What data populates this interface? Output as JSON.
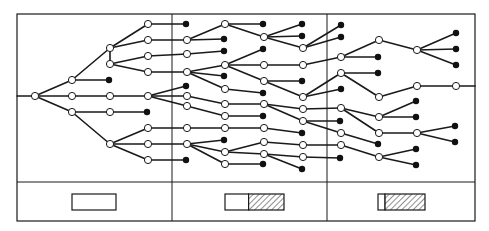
{
  "figure": {
    "title": "",
    "frame": {
      "x": 17,
      "y": 14,
      "width": 458,
      "height": 207
    },
    "legend_divider_y": 182,
    "column_dividers_x": [
      172,
      327
    ],
    "colors": {
      "line": "#1a1a1a",
      "background": "#ffffff",
      "filled_node": "#111111"
    }
  },
  "nodes": [
    {
      "id": "r",
      "x": 35,
      "y": 96,
      "type": "open"
    },
    {
      "id": "a1",
      "x": 72,
      "y": 80,
      "type": "open"
    },
    {
      "id": "a2",
      "x": 72,
      "y": 96,
      "type": "open"
    },
    {
      "id": "a3",
      "x": 72,
      "y": 112,
      "type": "open"
    },
    {
      "id": "b1",
      "x": 110,
      "y": 48,
      "type": "open"
    },
    {
      "id": "b2",
      "x": 110,
      "y": 64,
      "type": "open"
    },
    {
      "id": "b3",
      "x": 109,
      "y": 80,
      "type": "filled"
    },
    {
      "id": "b4",
      "x": 110,
      "y": 96,
      "type": "open"
    },
    {
      "id": "b5",
      "x": 110,
      "y": 112,
      "type": "open"
    },
    {
      "id": "b6",
      "x": 110,
      "y": 144,
      "type": "open"
    },
    {
      "id": "c1",
      "x": 148,
      "y": 24,
      "type": "open"
    },
    {
      "id": "c2",
      "x": 148,
      "y": 40,
      "type": "open"
    },
    {
      "id": "c3",
      "x": 148,
      "y": 56,
      "type": "open"
    },
    {
      "id": "c4",
      "x": 148,
      "y": 72,
      "type": "open"
    },
    {
      "id": "c5",
      "x": 148,
      "y": 96,
      "type": "open"
    },
    {
      "id": "c6",
      "x": 147,
      "y": 112,
      "type": "filled"
    },
    {
      "id": "c7",
      "x": 148,
      "y": 128,
      "type": "open"
    },
    {
      "id": "c8",
      "x": 148,
      "y": 144,
      "type": "open"
    },
    {
      "id": "c9",
      "x": 148,
      "y": 160,
      "type": "open"
    },
    {
      "id": "d1",
      "x": 186,
      "y": 24,
      "type": "filled"
    },
    {
      "id": "d2",
      "x": 187,
      "y": 40,
      "type": "open"
    },
    {
      "id": "d3",
      "x": 187,
      "y": 54,
      "type": "open"
    },
    {
      "id": "d4",
      "x": 187,
      "y": 72,
      "type": "open"
    },
    {
      "id": "d5",
      "x": 186,
      "y": 86,
      "type": "filled"
    },
    {
      "id": "d6",
      "x": 187,
      "y": 96,
      "type": "open"
    },
    {
      "id": "d7",
      "x": 187,
      "y": 106,
      "type": "open"
    },
    {
      "id": "d8",
      "x": 187,
      "y": 128,
      "type": "open"
    },
    {
      "id": "d9",
      "x": 187,
      "y": 144,
      "type": "open"
    },
    {
      "id": "d10",
      "x": 186,
      "y": 160,
      "type": "filled"
    },
    {
      "id": "e1",
      "x": 225,
      "y": 24,
      "type": "open"
    },
    {
      "id": "e2",
      "x": 224,
      "y": 39,
      "type": "filled"
    },
    {
      "id": "e3",
      "x": 224,
      "y": 51,
      "type": "filled"
    },
    {
      "id": "e4",
      "x": 225,
      "y": 65,
      "type": "open"
    },
    {
      "id": "e5",
      "x": 224,
      "y": 76,
      "type": "filled"
    },
    {
      "id": "e6",
      "x": 225,
      "y": 89,
      "type": "open"
    },
    {
      "id": "e7",
      "x": 225,
      "y": 104,
      "type": "open"
    },
    {
      "id": "e8",
      "x": 225,
      "y": 116,
      "type": "open"
    },
    {
      "id": "e9",
      "x": 225,
      "y": 128,
      "type": "open"
    },
    {
      "id": "e10",
      "x": 224,
      "y": 140,
      "type": "filled"
    },
    {
      "id": "e11",
      "x": 225,
      "y": 152,
      "type": "open"
    },
    {
      "id": "e12",
      "x": 225,
      "y": 164,
      "type": "open"
    },
    {
      "id": "f1",
      "x": 263,
      "y": 24,
      "type": "filled"
    },
    {
      "id": "f2",
      "x": 264,
      "y": 37,
      "type": "open"
    },
    {
      "id": "f3",
      "x": 263,
      "y": 49,
      "type": "filled"
    },
    {
      "id": "f4",
      "x": 264,
      "y": 65,
      "type": "open"
    },
    {
      "id": "f5",
      "x": 264,
      "y": 81,
      "type": "open"
    },
    {
      "id": "f6",
      "x": 263,
      "y": 93,
      "type": "filled"
    },
    {
      "id": "f7",
      "x": 264,
      "y": 104,
      "type": "open"
    },
    {
      "id": "f8",
      "x": 263,
      "y": 116,
      "type": "filled"
    },
    {
      "id": "f9",
      "x": 264,
      "y": 128,
      "type": "open"
    },
    {
      "id": "f10",
      "x": 264,
      "y": 142,
      "type": "open"
    },
    {
      "id": "f11",
      "x": 264,
      "y": 154,
      "type": "open"
    },
    {
      "id": "f12",
      "x": 263,
      "y": 164,
      "type": "filled"
    },
    {
      "id": "g1",
      "x": 302,
      "y": 24,
      "type": "filled"
    },
    {
      "id": "g2",
      "x": 302,
      "y": 36,
      "type": "filled"
    },
    {
      "id": "g3",
      "x": 303,
      "y": 48,
      "type": "open"
    },
    {
      "id": "g4",
      "x": 303,
      "y": 65,
      "type": "open"
    },
    {
      "id": "g5",
      "x": 302,
      "y": 81,
      "type": "filled"
    },
    {
      "id": "g6",
      "x": 303,
      "y": 97,
      "type": "open"
    },
    {
      "id": "g7",
      "x": 303,
      "y": 109,
      "type": "open"
    },
    {
      "id": "g8",
      "x": 303,
      "y": 121,
      "type": "open"
    },
    {
      "id": "g9",
      "x": 302,
      "y": 133,
      "type": "filled"
    },
    {
      "id": "g10",
      "x": 303,
      "y": 145,
      "type": "open"
    },
    {
      "id": "g11",
      "x": 303,
      "y": 157,
      "type": "open"
    },
    {
      "id": "g12",
      "x": 302,
      "y": 169,
      "type": "filled"
    },
    {
      "id": "h1",
      "x": 341,
      "y": 25,
      "type": "filled"
    },
    {
      "id": "h2",
      "x": 341,
      "y": 37,
      "type": "filled"
    },
    {
      "id": "h3",
      "x": 341,
      "y": 57,
      "type": "open"
    },
    {
      "id": "h4",
      "x": 341,
      "y": 73,
      "type": "open"
    },
    {
      "id": "h5",
      "x": 341,
      "y": 89,
      "type": "filled"
    },
    {
      "id": "h6",
      "x": 341,
      "y": 108,
      "type": "open"
    },
    {
      "id": "h7",
      "x": 340,
      "y": 121,
      "type": "filled"
    },
    {
      "id": "h8",
      "x": 341,
      "y": 133,
      "type": "open"
    },
    {
      "id": "h9",
      "x": 341,
      "y": 145,
      "type": "open"
    },
    {
      "id": "h10",
      "x": 340,
      "y": 158,
      "type": "filled"
    },
    {
      "id": "i1",
      "x": 379,
      "y": 40,
      "type": "open"
    },
    {
      "id": "i2",
      "x": 378,
      "y": 57,
      "type": "filled"
    },
    {
      "id": "i3",
      "x": 378,
      "y": 73,
      "type": "filled"
    },
    {
      "id": "i4",
      "x": 379,
      "y": 97,
      "type": "open"
    },
    {
      "id": "i5",
      "x": 379,
      "y": 117,
      "type": "open"
    },
    {
      "id": "i6",
      "x": 379,
      "y": 133,
      "type": "open"
    },
    {
      "id": "i7",
      "x": 378,
      "y": 144,
      "type": "filled"
    },
    {
      "id": "i8",
      "x": 379,
      "y": 157,
      "type": "open"
    },
    {
      "id": "j1",
      "x": 417,
      "y": 50,
      "type": "open"
    },
    {
      "id": "j2",
      "x": 417,
      "y": 86,
      "type": "open"
    },
    {
      "id": "j3",
      "x": 416,
      "y": 101,
      "type": "filled"
    },
    {
      "id": "j4",
      "x": 416,
      "y": 117,
      "type": "filled"
    },
    {
      "id": "j5",
      "x": 417,
      "y": 133,
      "type": "open"
    },
    {
      "id": "j6",
      "x": 416,
      "y": 149,
      "type": "filled"
    },
    {
      "id": "j7",
      "x": 416,
      "y": 165,
      "type": "filled"
    },
    {
      "id": "k1",
      "x": 456,
      "y": 33,
      "type": "filled"
    },
    {
      "id": "k2",
      "x": 456,
      "y": 49,
      "type": "filled"
    },
    {
      "id": "k3",
      "x": 456,
      "y": 65,
      "type": "filled"
    },
    {
      "id": "k4",
      "x": 456,
      "y": 86,
      "type": "open"
    },
    {
      "id": "k5",
      "x": 455,
      "y": 126,
      "type": "filled"
    },
    {
      "id": "k6",
      "x": 455,
      "y": 142,
      "type": "filled"
    }
  ],
  "edges": [
    [
      "r",
      "a1"
    ],
    [
      "r",
      "a2"
    ],
    [
      "r",
      "a3"
    ],
    [
      "a1",
      "b1"
    ],
    [
      "a1",
      "b3"
    ],
    [
      "a2",
      "b4"
    ],
    [
      "a3",
      "b5"
    ],
    [
      "a3",
      "b6"
    ],
    [
      "b1",
      "c1"
    ],
    [
      "b1",
      "c2"
    ],
    [
      "b2",
      "c3"
    ],
    [
      "b2",
      "c4"
    ],
    [
      "b1",
      "b2"
    ],
    [
      "b4",
      "c5"
    ],
    [
      "b5",
      "c6"
    ],
    [
      "b6",
      "c7"
    ],
    [
      "b6",
      "c8"
    ],
    [
      "b6",
      "c9"
    ],
    [
      "c1",
      "d1"
    ],
    [
      "c2",
      "d2"
    ],
    [
      "c3",
      "d3"
    ],
    [
      "c4",
      "d4"
    ],
    [
      "c5",
      "d5"
    ],
    [
      "c5",
      "d6"
    ],
    [
      "c5",
      "d7"
    ],
    [
      "c7",
      "d8"
    ],
    [
      "c8",
      "d9"
    ],
    [
      "c9",
      "d10"
    ],
    [
      "d2",
      "e1"
    ],
    [
      "d2",
      "e2"
    ],
    [
      "d3",
      "e3"
    ],
    [
      "d4",
      "e4"
    ],
    [
      "d4",
      "e5"
    ],
    [
      "d4",
      "e6"
    ],
    [
      "d6",
      "e7"
    ],
    [
      "d7",
      "e8"
    ],
    [
      "d8",
      "e9"
    ],
    [
      "d9",
      "e10"
    ],
    [
      "d9",
      "e11"
    ],
    [
      "d9",
      "e12"
    ],
    [
      "e1",
      "f1"
    ],
    [
      "e1",
      "f2"
    ],
    [
      "e4",
      "f3"
    ],
    [
      "e4",
      "f4"
    ],
    [
      "e4",
      "f5"
    ],
    [
      "e6",
      "f6"
    ],
    [
      "e7",
      "f7"
    ],
    [
      "e8",
      "f8"
    ],
    [
      "e9",
      "f9"
    ],
    [
      "e11",
      "f10"
    ],
    [
      "e11",
      "f11"
    ],
    [
      "e12",
      "f12"
    ],
    [
      "f2",
      "g1"
    ],
    [
      "f2",
      "g2"
    ],
    [
      "f2",
      "g3"
    ],
    [
      "f4",
      "g4"
    ],
    [
      "f5",
      "g5"
    ],
    [
      "f5",
      "g6"
    ],
    [
      "f7",
      "g7"
    ],
    [
      "f7",
      "g8"
    ],
    [
      "f9",
      "g9"
    ],
    [
      "f10",
      "g10"
    ],
    [
      "f11",
      "g11"
    ],
    [
      "f11",
      "g12"
    ],
    [
      "g3",
      "h1"
    ],
    [
      "g3",
      "h2"
    ],
    [
      "g4",
      "h3"
    ],
    [
      "g6",
      "h4"
    ],
    [
      "g6",
      "h5"
    ],
    [
      "g7",
      "h6"
    ],
    [
      "g8",
      "h7"
    ],
    [
      "g8",
      "h8"
    ],
    [
      "g10",
      "h9"
    ],
    [
      "g11",
      "h10"
    ],
    [
      "h3",
      "i1"
    ],
    [
      "h3",
      "i2"
    ],
    [
      "h4",
      "i3"
    ],
    [
      "h4",
      "i4"
    ],
    [
      "h6",
      "i5"
    ],
    [
      "h6",
      "i6"
    ],
    [
      "h8",
      "i7"
    ],
    [
      "h9",
      "i8"
    ],
    [
      "i1",
      "j1"
    ],
    [
      "i4",
      "j2"
    ],
    [
      "i5",
      "j3"
    ],
    [
      "i5",
      "j4"
    ],
    [
      "i6",
      "j5"
    ],
    [
      "i8",
      "j6"
    ],
    [
      "i8",
      "j7"
    ],
    [
      "j1",
      "k1"
    ],
    [
      "j1",
      "k2"
    ],
    [
      "j1",
      "k3"
    ],
    [
      "j2",
      "k4"
    ],
    [
      "j5",
      "k5"
    ],
    [
      "j5",
      "k6"
    ]
  ],
  "stub_edges": [
    {
      "from": [
        17,
        96
      ],
      "to": "r"
    },
    {
      "from_node": "k4",
      "to": [
        475,
        86
      ]
    }
  ],
  "legend": [
    {
      "panel": 1,
      "x": 72,
      "y": 194,
      "width": 44,
      "height": 16,
      "hatched_fraction": 0
    },
    {
      "panel": 2,
      "x": 225,
      "y": 194,
      "width": 59,
      "height": 16,
      "hatched_fraction": 0.6
    },
    {
      "panel": 3,
      "x": 378,
      "y": 194,
      "width": 47,
      "height": 16,
      "hatched_fraction": 0.85
    }
  ]
}
